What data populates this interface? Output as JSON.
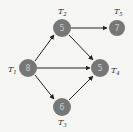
{
  "diagram": {
    "type": "task-dependency-graph",
    "colors": {
      "background": "#f5f5f3",
      "node": "#777777",
      "node_text": "#c8c8c8",
      "edge": "#222222",
      "label": "#333333"
    },
    "nodes": [
      {
        "id": "T1",
        "letter": "T",
        "sub": "1",
        "value": "8",
        "cx": 28,
        "cy": 68
      },
      {
        "id": "T2",
        "letter": "T",
        "sub": "2",
        "value": "5",
        "cx": 62,
        "cy": 28
      },
      {
        "id": "T3",
        "letter": "T",
        "sub": "3",
        "value": "6",
        "cx": 62,
        "cy": 107
      },
      {
        "id": "T4",
        "letter": "T",
        "sub": "4",
        "value": "5",
        "cx": 100,
        "cy": 68
      },
      {
        "id": "T5",
        "letter": "T",
        "sub": "5",
        "value": "7",
        "cx": 117,
        "cy": 28
      }
    ],
    "edges": [
      {
        "from": "T1",
        "to": "T2"
      },
      {
        "from": "T1",
        "to": "T4"
      },
      {
        "from": "T1",
        "to": "T3"
      },
      {
        "from": "T2",
        "to": "T5"
      },
      {
        "from": "T2",
        "to": "T4"
      },
      {
        "from": "T3",
        "to": "T4"
      }
    ]
  }
}
